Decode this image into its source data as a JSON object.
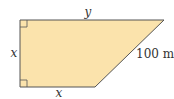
{
  "diagram": {
    "shape": "right trapezoid",
    "fill_color": "#fbe3ac",
    "stroke_color": "#555555",
    "labels": {
      "top": "y",
      "left": "x",
      "bottom": "x",
      "slant": "100 m"
    },
    "right_angle_markers": [
      "top-left",
      "bottom-left"
    ]
  }
}
